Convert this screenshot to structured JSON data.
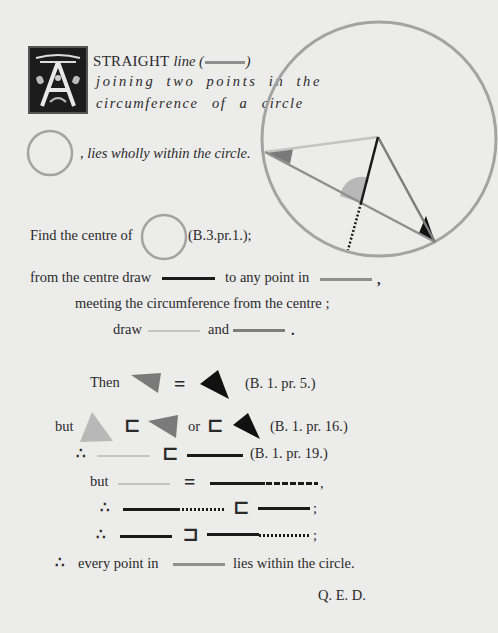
{
  "colors": {
    "background": "#ececea",
    "black_line": "#1a1a1a",
    "gray_line": "#8f8f8f",
    "light_line": "#c4c4c4",
    "mid_line": "#7d7d7d",
    "circle_stroke": "#a3a3a3",
    "gray_angle": "#7a7a7a",
    "light_angle": "#b8b8b8",
    "black_angle": "#111111"
  },
  "intro": {
    "initial_letter": "A",
    "line1_caps": "STRAIGHT",
    "line1_ital": "line (",
    "line1_close": ")",
    "line2": "joining two points in the",
    "line3": "circumference of a circle",
    "line4": ", lies wholly within the circle."
  },
  "construction": {
    "find_label": "Find the centre of",
    "find_ref": "(B.3.pr.1.);",
    "from_label": "from the centre draw",
    "to_label": "to any point in",
    "to_comma": ",",
    "meeting_label": "meeting the circumference from the centre ;",
    "draw_label": "draw",
    "and_label": "and",
    "end_period": "."
  },
  "proof": {
    "then_label": "Then",
    "equals": "=",
    "ref_1": "(B. 1. pr. 5.)",
    "but_label": "but",
    "subset": "⊏",
    "or_label": "or",
    "ref_2": "(B. 1. pr. 16.)",
    "therefore": "∴",
    "ref_3": "(B. 1. pr. 19.)",
    "but2_label": "but",
    "comma": ",",
    "semicolon": ";",
    "superset": "⊐",
    "final_label": "every point in",
    "final_tail": "lies within the circle.",
    "qed": "Q. E. D."
  }
}
